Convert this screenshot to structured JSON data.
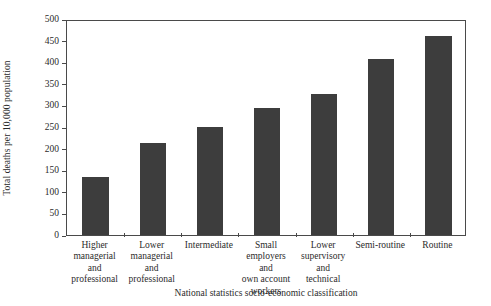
{
  "chart_data": {
    "type": "bar",
    "title": "",
    "xlabel": "National statistics socio-economic classification",
    "ylabel": "Total deaths per 10,000 population",
    "categories": [
      "Higher managerial and professional",
      "Lower managerial and professional",
      "Intermediate",
      "Small employers and own account workers",
      "Lower supervisory and technical",
      "Semi-routine",
      "Routine"
    ],
    "category_lines": [
      [
        "Higher",
        "managerial",
        "and",
        "professional"
      ],
      [
        "Lower",
        "managerial",
        "and",
        "professional"
      ],
      [
        "Intermediate"
      ],
      [
        "Small employers",
        "and",
        "own account",
        "workers"
      ],
      [
        "Lower",
        "supervisory",
        "and",
        "technical"
      ],
      [
        "Semi-routine"
      ],
      [
        "Routine"
      ]
    ],
    "values": [
      135,
      212,
      250,
      295,
      327,
      408,
      461
    ],
    "ylim": [
      0,
      500
    ],
    "yticks": [
      0,
      50,
      100,
      150,
      200,
      250,
      300,
      350,
      400,
      450,
      500
    ],
    "ytick_labels": [
      "0",
      "50",
      "100",
      "150",
      "200",
      "250",
      "300",
      "350",
      "400",
      "450",
      "500"
    ],
    "grid": false,
    "legend": "none",
    "bar_color": "#3d3d3d",
    "axis_color": "#4a4a4a",
    "background_color": "#ffffff"
  }
}
